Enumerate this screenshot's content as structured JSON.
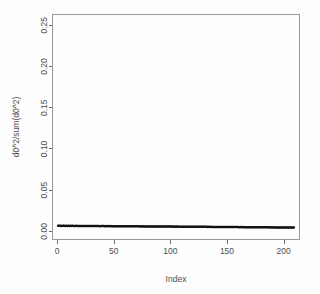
{
  "chart_data": {
    "type": "scatter",
    "title": "",
    "xlabel": "Index",
    "ylabel": "d0^2/sum(d0^2)",
    "xlim": [
      -4,
      214
    ],
    "ylim": [
      -0.0105,
      0.2625
    ],
    "xticks": [
      0,
      50,
      100,
      150,
      200
    ],
    "xtick_labels": [
      "0",
      "50",
      "100",
      "150",
      "200"
    ],
    "yticks": [
      0.0,
      0.05,
      0.1,
      0.15,
      0.2,
      0.25
    ],
    "ytick_labels": [
      "0.00",
      "0.05",
      "0.10",
      "0.15",
      "0.20",
      "0.25"
    ],
    "grid": false,
    "legend": null,
    "point_color": "#111111",
    "point_symbol": "circle",
    "n_points": 209,
    "x": [
      1,
      2,
      3,
      4,
      5,
      6,
      7,
      8,
      9,
      10,
      11,
      12,
      13,
      14,
      15,
      16,
      17,
      18,
      19,
      20,
      21,
      22,
      23,
      24,
      25,
      26,
      27,
      28,
      29,
      30,
      31,
      32,
      33,
      34,
      35,
      36,
      37,
      38,
      39,
      40,
      41,
      42,
      43,
      44,
      45,
      46,
      47,
      48,
      49,
      50,
      51,
      52,
      53,
      54,
      55,
      56,
      57,
      58,
      59,
      60,
      61,
      62,
      63,
      64,
      65,
      66,
      67,
      68,
      69,
      70,
      71,
      72,
      73,
      74,
      75,
      76,
      77,
      78,
      79,
      80,
      81,
      82,
      83,
      84,
      85,
      86,
      87,
      88,
      89,
      90,
      91,
      92,
      93,
      94,
      95,
      96,
      97,
      98,
      99,
      100,
      101,
      102,
      103,
      104,
      105,
      106,
      107,
      108,
      109,
      110,
      111,
      112,
      113,
      114,
      115,
      116,
      117,
      118,
      119,
      120,
      121,
      122,
      123,
      124,
      125,
      126,
      127,
      128,
      129,
      130,
      131,
      132,
      133,
      134,
      135,
      136,
      137,
      138,
      139,
      140,
      141,
      142,
      143,
      144,
      145,
      146,
      147,
      148,
      149,
      150,
      151,
      152,
      153,
      154,
      155,
      156,
      157,
      158,
      159,
      160,
      161,
      162,
      163,
      164,
      165,
      166,
      167,
      168,
      169,
      170,
      171,
      172,
      173,
      174,
      175,
      176,
      177,
      178,
      179,
      180,
      181,
      182,
      183,
      184,
      185,
      186,
      187,
      188,
      189,
      190,
      191,
      192,
      193,
      194,
      195,
      196,
      197,
      198,
      199,
      200,
      201,
      202,
      203,
      204,
      205,
      206,
      207,
      208,
      209
    ],
    "y": [
      0.0062,
      0.0061,
      0.0062,
      0.006,
      0.0061,
      0.0062,
      0.006,
      0.0061,
      0.006,
      0.0062,
      0.0059,
      0.0061,
      0.006,
      0.0061,
      0.0059,
      0.006,
      0.0061,
      0.0059,
      0.006,
      0.006,
      0.0059,
      0.006,
      0.0059,
      0.006,
      0.0058,
      0.006,
      0.0059,
      0.0059,
      0.006,
      0.0058,
      0.0059,
      0.0058,
      0.0059,
      0.0058,
      0.0059,
      0.0058,
      0.0059,
      0.0057,
      0.0058,
      0.0058,
      0.0058,
      0.0057,
      0.0058,
      0.0057,
      0.0058,
      0.0057,
      0.0058,
      0.0057,
      0.0057,
      0.0057,
      0.0057,
      0.0056,
      0.0057,
      0.0056,
      0.0057,
      0.0056,
      0.0057,
      0.0056,
      0.0056,
      0.0056,
      0.0056,
      0.0056,
      0.0055,
      0.0056,
      0.0055,
      0.0056,
      0.0055,
      0.0055,
      0.0055,
      0.0055,
      0.0055,
      0.0055,
      0.0054,
      0.0055,
      0.0054,
      0.0055,
      0.0054,
      0.0054,
      0.0054,
      0.0054,
      0.0054,
      0.0054,
      0.0053,
      0.0054,
      0.0053,
      0.0054,
      0.0053,
      0.0053,
      0.0053,
      0.0053,
      0.0053,
      0.0053,
      0.0052,
      0.0053,
      0.0052,
      0.0053,
      0.0052,
      0.0052,
      0.0052,
      0.0052,
      0.0052,
      0.0052,
      0.0051,
      0.0052,
      0.0051,
      0.0052,
      0.0051,
      0.0051,
      0.0051,
      0.0051,
      0.0051,
      0.0051,
      0.005,
      0.0051,
      0.005,
      0.0051,
      0.005,
      0.005,
      0.005,
      0.005,
      0.005,
      0.005,
      0.0049,
      0.005,
      0.0049,
      0.005,
      0.0049,
      0.0049,
      0.0049,
      0.0049,
      0.0049,
      0.0049,
      0.0048,
      0.0049,
      0.0048,
      0.0049,
      0.0048,
      0.0048,
      0.0048,
      0.0048,
      0.0048,
      0.0048,
      0.0047,
      0.0048,
      0.0047,
      0.0048,
      0.0047,
      0.0047,
      0.0047,
      0.0047,
      0.0047,
      0.0046,
      0.0047,
      0.0046,
      0.0047,
      0.0046,
      0.0046,
      0.0046,
      0.0046,
      0.0046,
      0.0045,
      0.0046,
      0.0045,
      0.0046,
      0.0045,
      0.0045,
      0.0045,
      0.0045,
      0.0045,
      0.0044,
      0.0045,
      0.0044,
      0.0045,
      0.0044,
      0.0044,
      0.0044,
      0.0044,
      0.0044,
      0.0043,
      0.0044,
      0.0043,
      0.0044,
      0.0043,
      0.0043,
      0.0043,
      0.0043,
      0.0043,
      0.0042,
      0.0043,
      0.0042,
      0.0043,
      0.0042,
      0.0042,
      0.0042,
      0.0042,
      0.0042,
      0.0041,
      0.0042,
      0.0041,
      0.0042,
      0.0041,
      0.0041,
      0.0041,
      0.0041,
      0.004,
      0.0041,
      0.004,
      0.0041,
      0.004
    ]
  }
}
